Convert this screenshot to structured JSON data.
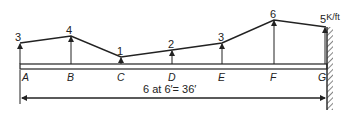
{
  "diagram": {
    "unit_label": "K/ft",
    "dimension_label": "6 at 6′= 36′",
    "stations": [
      {
        "name": "A",
        "load": "3"
      },
      {
        "name": "B",
        "load": "4"
      },
      {
        "name": "C",
        "load": "1"
      },
      {
        "name": "D",
        "load": "2"
      },
      {
        "name": "E",
        "load": "3"
      },
      {
        "name": "F",
        "load": "6"
      },
      {
        "name": "G",
        "load": "5"
      }
    ],
    "support": "fixed-wall-right",
    "colors": {
      "line": "#222222",
      "background": "#ffffff"
    }
  }
}
